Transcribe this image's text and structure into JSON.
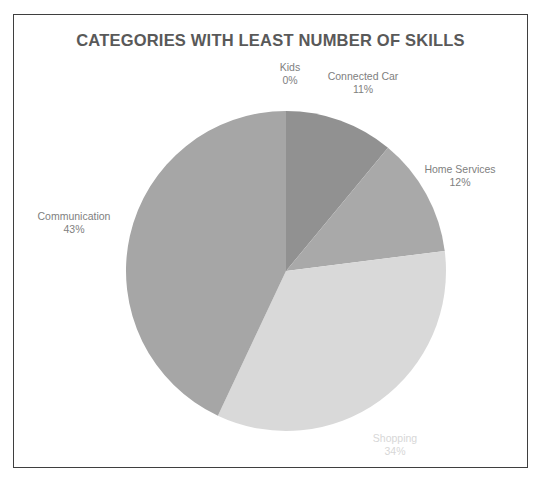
{
  "chart_data": {
    "type": "pie",
    "title": "CATEGORIES WITH LEAST NUMBER OF SKILLS",
    "xlabel": "",
    "ylabel": "",
    "legend": "none",
    "grid": false,
    "labels_shown": "category name and percentage, outside slices",
    "start_angle_deg": 0,
    "direction": "clockwise",
    "categories": [
      "Kids",
      "Connected Car",
      "Home Services",
      "Shopping",
      "Communication"
    ],
    "values": [
      0,
      11,
      12,
      34,
      43
    ],
    "value_labels": [
      "0%",
      "11%",
      "12%",
      "34%",
      "43%"
    ],
    "colors": [
      "#8f8f8f",
      "#919191",
      "#a9a9a9",
      "#d9d9d9",
      "#a6a6a6"
    ],
    "slices": [
      {
        "name": "Kids",
        "percent": 0,
        "percent_label": "0%",
        "color": "#8f8f8f",
        "label_color": "#808080"
      },
      {
        "name": "Connected Car",
        "percent": 11,
        "percent_label": "11%",
        "color": "#919191",
        "label_color": "#808080"
      },
      {
        "name": "Home Services",
        "percent": 12,
        "percent_label": "12%",
        "color": "#a9a9a9",
        "label_color": "#808080"
      },
      {
        "name": "Shopping",
        "percent": 34,
        "percent_label": "34%",
        "color": "#d9d9d9",
        "label_color": "#d7d7d7"
      },
      {
        "name": "Communication",
        "percent": 43,
        "percent_label": "43%",
        "color": "#a6a6a6",
        "label_color": "#808080"
      }
    ]
  },
  "frame": {
    "border_color": "#3f3f3f",
    "background": "#ffffff"
  },
  "title": {
    "text": "CATEGORIES WITH LEAST NUMBER OF SKILLS",
    "color": "#595959"
  }
}
